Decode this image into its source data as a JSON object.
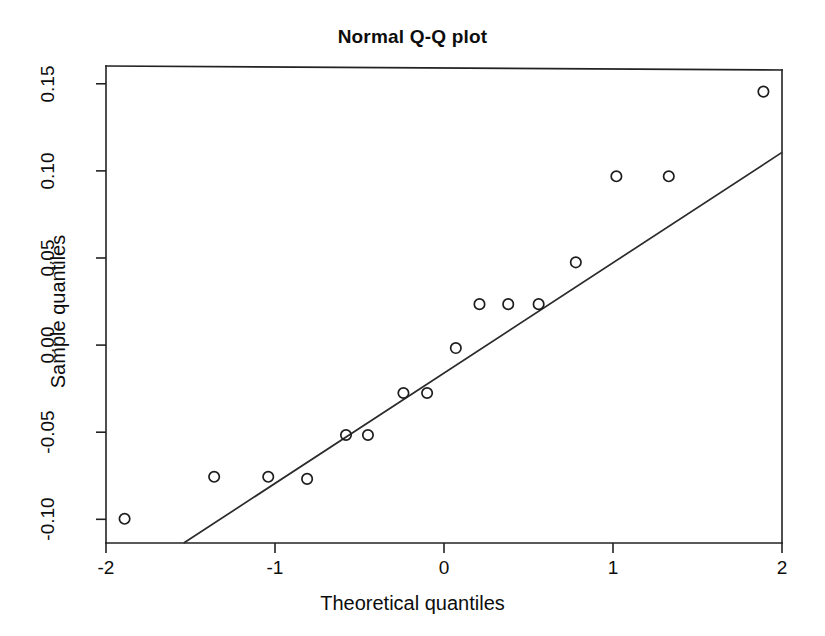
{
  "chart_data": {
    "type": "scatter",
    "title": "Normal Q-Q plot",
    "xlabel": "Theoretical quantiles",
    "ylabel": "Sample quantiles",
    "xlim": [
      -2.0,
      2.0
    ],
    "ylim": [
      -0.1136,
      0.1602
    ],
    "grid": false,
    "legend": null,
    "xticks": [
      -2,
      -1,
      0,
      1,
      2
    ],
    "xtick_labels": [
      "-2",
      "-1",
      "0",
      "1",
      "2"
    ],
    "yticks": [
      -0.1,
      -0.05,
      0.0,
      0.05,
      0.1,
      0.15
    ],
    "ytick_labels": [
      "-0.10",
      "-0.05",
      "0.00",
      "0.05",
      "0.10",
      "0.15"
    ],
    "marker": "open-circle",
    "point_color": "#1d1d1d",
    "line_color": "#2b2b2b",
    "x": [
      -1.89,
      -1.36,
      -1.04,
      -0.81,
      -0.58,
      -0.45,
      -0.24,
      -0.1,
      0.07,
      0.21,
      0.38,
      0.56,
      0.78,
      1.02,
      1.33,
      1.89
    ],
    "y": [
      -0.0997,
      -0.0756,
      -0.0756,
      -0.0768,
      -0.0516,
      -0.0516,
      -0.0275,
      -0.0275,
      -0.0017,
      0.0235,
      0.0235,
      0.0235,
      0.0475,
      0.0969,
      0.0969,
      0.1455
    ],
    "points": [
      {
        "x": -1.89,
        "y": -0.0997
      },
      {
        "x": -1.36,
        "y": -0.0756
      },
      {
        "x": -1.04,
        "y": -0.0756
      },
      {
        "x": -0.81,
        "y": -0.0768
      },
      {
        "x": -0.58,
        "y": -0.0516
      },
      {
        "x": -0.45,
        "y": -0.0516
      },
      {
        "x": -0.24,
        "y": -0.0275
      },
      {
        "x": -0.1,
        "y": -0.0275
      },
      {
        "x": 0.07,
        "y": -0.0017
      },
      {
        "x": 0.21,
        "y": 0.0235
      },
      {
        "x": 0.38,
        "y": 0.0235
      },
      {
        "x": 0.56,
        "y": 0.0235
      },
      {
        "x": 0.78,
        "y": 0.0475
      },
      {
        "x": 1.02,
        "y": 0.0969
      },
      {
        "x": 1.33,
        "y": 0.0969
      },
      {
        "x": 1.89,
        "y": 0.1455
      }
    ],
    "reference_line": {
      "description": "qqline through first and third quartiles",
      "x1": -1.54,
      "y1": -0.1136,
      "x2": 2.0,
      "y2": 0.1106
    }
  }
}
